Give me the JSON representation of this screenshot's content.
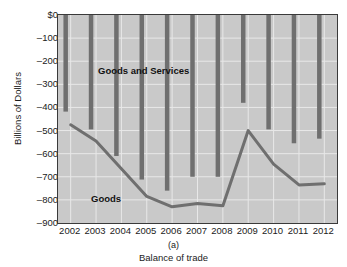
{
  "figure": {
    "panel_letter": "(a)",
    "caption": "Balance of trade",
    "y_axis_title": "Billions of Dollars",
    "series_labels": {
      "goods_and_services": "Goods and Services",
      "goods": "Goods"
    },
    "colors": {
      "plot_background": "#c9c9c9",
      "bar": "#6f6f6f",
      "line": "#6f6f6f",
      "gridline": "#e8e8e8",
      "frame": "#3a3a3a",
      "text": "#1b1b1b"
    }
  },
  "chart_data": {
    "type": "bar",
    "title": "Balance of trade",
    "xlabel": "",
    "ylabel": "Billions of Dollars",
    "ylim": [
      -900,
      0
    ],
    "ytick_labels": [
      "$0",
      "–100",
      "–200",
      "–300",
      "–400",
      "–500",
      "–600",
      "–700",
      "–800",
      "–900"
    ],
    "ytick_values": [
      0,
      -100,
      -200,
      -300,
      -400,
      -500,
      -600,
      -700,
      -800,
      -900
    ],
    "grid": true,
    "legend": "inline-labels",
    "categories": [
      "2002",
      "2003",
      "2004",
      "2005",
      "2006",
      "2007",
      "2008",
      "2009",
      "2010",
      "2011",
      "2012"
    ],
    "series": [
      {
        "name": "Goods and Services",
        "render": "bar",
        "values": [
          -418,
          -495,
          -610,
          -712,
          -760,
          -700,
          -700,
          -380,
          -495,
          -555,
          -535
        ]
      },
      {
        "name": "Goods",
        "render": "line",
        "values": [
          -475,
          -545,
          -665,
          -785,
          -830,
          -815,
          -825,
          -500,
          -645,
          -735,
          -730
        ]
      }
    ]
  }
}
